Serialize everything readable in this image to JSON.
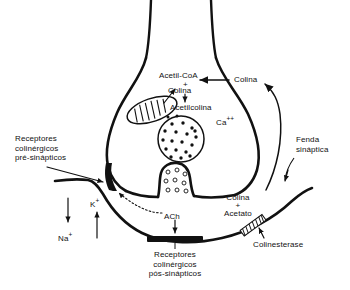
{
  "diagram": {
    "background_color": "#ffffff",
    "ink_color": "#111111",
    "labels": {
      "acetil_coa": "Acetil-CoA",
      "plus_top": "+",
      "colina_inner": "Colina",
      "acetilcolina": "Acetilcolina",
      "colina_uptake": "Colina",
      "calcium": "Ca",
      "calcium_charge": "++",
      "receptores_pre_line1": "Receptores",
      "receptores_pre_line2": "colinérgicos",
      "receptores_pre_line3": "pré-sinápticos",
      "fenda_line1": "Fenda",
      "fenda_line2": "sináptica",
      "colina_cleft": "Colina",
      "plus_cleft": "+",
      "acetato": "Acetato",
      "colinesterase": "Colinesterase",
      "sodium": "Na",
      "sodium_charge": "+",
      "potassium": "K",
      "potassium_charge": "+",
      "ach": "ACh",
      "receptores_pos_line1": "Receptores",
      "receptores_pos_line2": "colinérgicos",
      "receptores_pos_line3": "pós-sinápticos"
    },
    "icons": {
      "mitochondrion": "mitochondrion-icon",
      "vesicle": "synaptic-vesicle-icon",
      "fusing_vesicle": "fusing-vesicle-icon",
      "presynaptic_receptor": "presynaptic-receptor-icon",
      "postsynaptic_receptor": "postsynaptic-receptor-icon",
      "cholinesterase": "cholinesterase-enzyme-icon"
    }
  }
}
